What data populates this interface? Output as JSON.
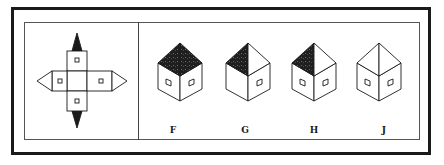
{
  "figure": {
    "net_panel": {
      "description": "Unfolded net of a house: square base with four walls, each wall has a small square window; top and bottom walls have triangular roof pieces (shaded), left and right walls have unshaded triangular roof pieces",
      "shaded_roof_pieces": [
        "top",
        "bottom"
      ],
      "unshaded_roof_pieces": [
        "left",
        "right"
      ]
    },
    "options": [
      {
        "label": "F",
        "roof_left": "shaded",
        "roof_right": "shaded",
        "left_window": true,
        "right_window": true
      },
      {
        "label": "G",
        "roof_left": "shaded",
        "roof_right": "white",
        "left_window": false,
        "right_window": true
      },
      {
        "label": "H",
        "roof_left": "shaded",
        "roof_right": "white",
        "left_window": true,
        "right_window": true
      },
      {
        "label": "J",
        "roof_left": "white",
        "roof_right": "white",
        "left_window": true,
        "right_window": true
      }
    ]
  },
  "colors": {
    "ink": "#1a1a1a",
    "shade": "#222222",
    "paper": "#ffffff"
  }
}
